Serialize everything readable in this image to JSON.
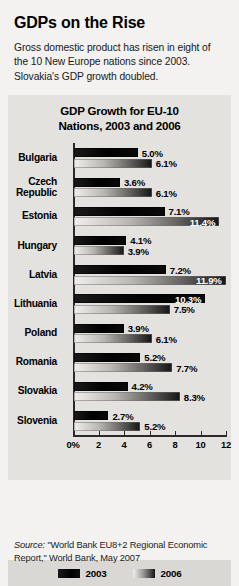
{
  "headline": "GDPs on the Rise",
  "deck": "Gross domestic product has risen in eight of the 10 New Europe nations since 2003. Slovakia's GDP growth doubled.",
  "chart_title_line1": "GDP Growth for EU-10",
  "chart_title_line2": "Nations, 2003 and 2006",
  "legend": {
    "series1_label": "2003",
    "series2_label": "2006",
    "series1_color": "#000000",
    "series2_color": "#9d9b98"
  },
  "source": {
    "prefix": "Source:",
    "text": "\"World Bank EU8+2 Regional Economic Report,\" World Bank, May 2007"
  },
  "chart_data": {
    "type": "bar",
    "orientation": "horizontal",
    "title": "GDP Growth for EU-10 Nations, 2003 and 2006",
    "xlabel": "",
    "ylabel": "",
    "xlim": [
      0,
      12
    ],
    "grid": false,
    "legend_position": "bottom",
    "tick_labels": [
      "0%",
      "2",
      "4",
      "6",
      "8",
      "10",
      "12"
    ],
    "tick_values": [
      0,
      2,
      4,
      6,
      8,
      10,
      12
    ],
    "categories": [
      "Bulgaria",
      "Czech Republic",
      "Estonia",
      "Hungary",
      "Latvia",
      "Lithuania",
      "Poland",
      "Romania",
      "Slovakia",
      "Slovenia"
    ],
    "series": [
      {
        "name": "2003",
        "values": [
          5.0,
          3.6,
          7.1,
          4.1,
          7.2,
          10.3,
          3.9,
          5.2,
          4.2,
          2.7
        ],
        "labels": [
          "5.0%",
          "3.6%",
          "7.1%",
          "4.1%",
          "7.2%",
          "10.3%",
          "3.9%",
          "5.2%",
          "4.2%",
          "2.7%"
        ]
      },
      {
        "name": "2006",
        "values": [
          6.1,
          6.1,
          11.4,
          3.9,
          11.9,
          7.5,
          6.1,
          7.7,
          8.3,
          5.2
        ],
        "labels": [
          "6.1%",
          "6.1%",
          "11.4%",
          "3.9%",
          "11.9%",
          "7.5%",
          "6.1%",
          "7.7%",
          "8.3%",
          "5.2%"
        ]
      }
    ]
  }
}
